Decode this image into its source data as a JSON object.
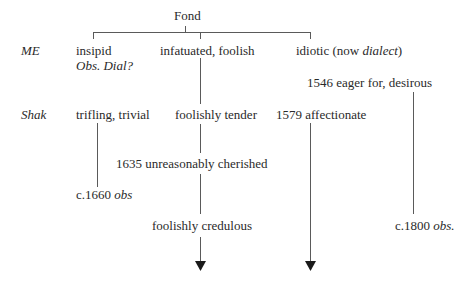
{
  "diagram": {
    "root": "Fond",
    "rows": {
      "me_label": "ME",
      "shak_label": "Shak"
    },
    "nodes": {
      "insipid": "insipid",
      "insipid_note_obs": "Obs. Dial?",
      "infatuated": "infatuated, foolish",
      "idiotic_pre": "idiotic (now ",
      "idiotic_dialect": "dialect",
      "idiotic_post": ")",
      "eager": "1546 eager for, desirous",
      "trifling": "trifling, trivial",
      "foolishly_tender": "foolishly tender",
      "affectionate": "1579 affectionate",
      "cherished": "1635 unreasonably cherished",
      "c1660_date": "c.1660 ",
      "c1660_obs": "obs",
      "credulous": "foolishly credulous",
      "c1800_date": "c.1800 ",
      "c1800_obs": "obs."
    },
    "line_color": "#5a5a5a",
    "arrow_color": "#1a1a1a"
  }
}
